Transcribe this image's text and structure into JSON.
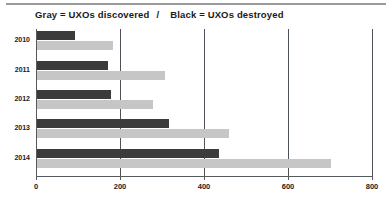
{
  "chart_data": {
    "type": "bar",
    "orientation": "horizontal",
    "title_segments": {
      "left": "Gray = UXOs discovered",
      "separator": "/",
      "right": "Black = UXOs destroyed"
    },
    "xlabel": "",
    "ylabel": "",
    "categories": [
      "2010",
      "2011",
      "2012",
      "2013",
      "2014"
    ],
    "series": [
      {
        "name": "UXOs destroyed",
        "color": "#3b3b3b",
        "legend_key": "Black",
        "values": [
          90,
          170,
          175,
          315,
          433
        ]
      },
      {
        "name": "UXOs discovered",
        "color": "#c6c6c6",
        "legend_key": "Gray",
        "values": [
          180,
          305,
          275,
          457,
          700
        ]
      }
    ],
    "xlim": [
      0,
      800
    ],
    "xticks": [
      0,
      200,
      400,
      600,
      800
    ],
    "xtick_labels": [
      "0",
      "200",
      "400",
      "600",
      "800"
    ],
    "grid": "vertical",
    "legend_position": "title"
  },
  "colors": {
    "black_series": "#3b3b3b",
    "gray_series": "#c6c6c6",
    "axis": "#555a5f",
    "grid": "#4e5359",
    "text": "#1a1a1a",
    "rule": "#9a9a9a",
    "background": "#ffffff"
  }
}
